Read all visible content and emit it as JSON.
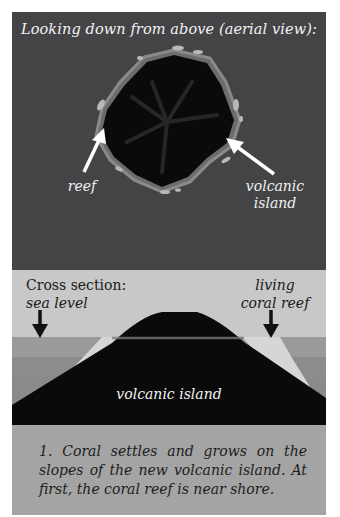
{
  "aerial": {
    "title": "Looking down from above (aerial view):",
    "labels": {
      "reef": "reef",
      "volcanic_island_line1": "volcanic",
      "volcanic_island_line2": "island"
    }
  },
  "cross_section": {
    "title": "Cross section:",
    "sea_level_label": "sea level",
    "living_reef_line1": "living",
    "living_reef_line2": "coral reef",
    "island_label": "volcanic island"
  },
  "caption": {
    "text": "1. Coral settles and grows on the slopes of the new volcanic island. At first, the coral reef is near shore."
  },
  "colors": {
    "aerial_bg": "#444446",
    "island": "#0a0a0a",
    "reef": "#b4b4b4",
    "sky": "#c8c8c8",
    "sea": "#8c8c8c",
    "caption_bg": "#a4a4a4"
  }
}
